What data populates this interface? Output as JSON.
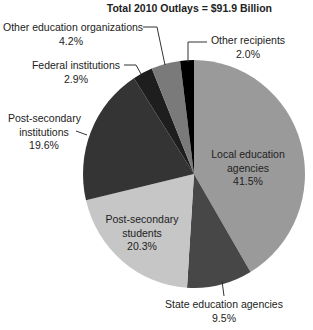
{
  "chart_data": {
    "type": "pie",
    "title": "Total 2010 Outlays = $91.9 Billion",
    "start_angle": "top, clockwise",
    "slices": [
      {
        "label": "Local education agencies",
        "value": 41.5,
        "display": "41.5%",
        "color": "#9a9a9a"
      },
      {
        "label": "State education agencies",
        "value": 9.5,
        "display": "9.5%",
        "color": "#474747"
      },
      {
        "label": "Post-secondary students",
        "value": 20.3,
        "display": "20.3%",
        "color": "#c6c6c6"
      },
      {
        "label": "Post-secondary institutions",
        "value": 19.6,
        "display": "19.6%",
        "color": "#343434"
      },
      {
        "label": "Federal institutions",
        "value": 2.9,
        "display": "2.9%",
        "color": "#1e1e1e"
      },
      {
        "label": "Other education organizations",
        "value": 4.2,
        "display": "4.2%",
        "color": "#7a7a7a"
      },
      {
        "label": "Other recipients",
        "value": 2.0,
        "display": "2.0%",
        "color": "#000000"
      }
    ]
  },
  "labels": {
    "local": [
      "Local education",
      "agencies",
      "41.5%"
    ],
    "state": [
      "State education agencies",
      "9.5%"
    ],
    "ps_students": [
      "Post-secondary",
      "students",
      "20.3%"
    ],
    "ps_institutions": [
      "Post-secondary",
      "institutions",
      "19.6%"
    ],
    "federal": [
      "Federal institutions",
      "2.9%"
    ],
    "other_ed": [
      "Other education organizations",
      "4.2%"
    ],
    "other_recip": [
      "Other recipients",
      "2.0%"
    ]
  }
}
